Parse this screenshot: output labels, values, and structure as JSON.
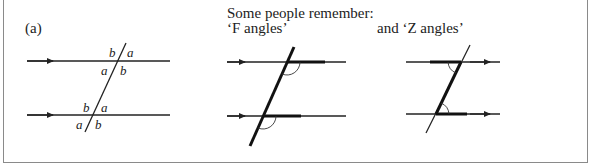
{
  "figure": {
    "panel_label": "(a)",
    "heading": "Some people remember:",
    "f_caption": "‘F angles’",
    "z_caption": "and  ‘Z angles’"
  },
  "panel_a": {
    "labels": {
      "top_upper_left": "b",
      "top_upper_right": "a",
      "top_lower_left": "a",
      "top_lower_right": "b",
      "bottom_upper_left": "b",
      "bottom_upper_right": "a",
      "bottom_lower_left": "a",
      "bottom_lower_right": "b"
    }
  },
  "colors": {
    "line": "#222222",
    "frame": "#8a8a8a",
    "background": "#ffffff"
  }
}
